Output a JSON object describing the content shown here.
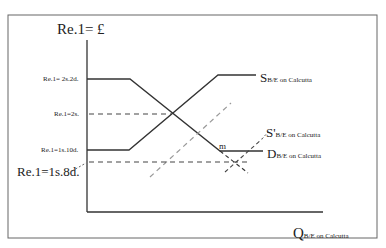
{
  "diagram": {
    "y_axis_title": "Re.1= £",
    "x_axis_title": {
      "main": "Q",
      "sub": "B/E on Calcutta"
    },
    "price_levels": [
      {
        "label": "Re.1= 2s.2d.",
        "role": "upper-gold-point"
      },
      {
        "label": "Re.1=2s.",
        "role": "par"
      },
      {
        "label": "Re.1=1s.10d.",
        "role": "lower-gold-point"
      },
      {
        "label": "Re.1=1s.8d.",
        "role": "new-equilibrium"
      }
    ],
    "curves": [
      {
        "name": "S",
        "sub": "B/E on Calcutta",
        "style": "solid"
      },
      {
        "name": "S'",
        "sub": "B/E on Calcutta",
        "style": "dashed-grey"
      },
      {
        "name": "D",
        "sub": "B/E on Calcutta",
        "style": "solid"
      }
    ],
    "point_label": "m"
  },
  "colors": {
    "line": "#333333",
    "dashed_grey": "#9a9a9a",
    "frame": "#555555"
  }
}
